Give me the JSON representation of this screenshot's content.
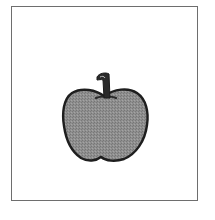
{
  "image": {
    "subject": "apple",
    "icon": "apple-icon",
    "frame_color": "#6e6e6e",
    "fill_color": "#8c8c8c",
    "outline_color": "#1e1e1e",
    "stem_color": "#2a2a2a"
  }
}
